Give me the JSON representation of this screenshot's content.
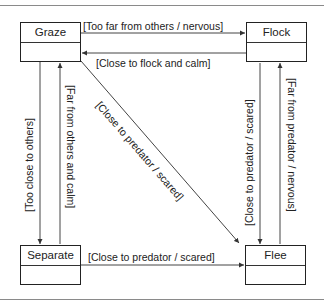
{
  "diagram": {
    "type": "state-diagram",
    "states": [
      {
        "id": "graze",
        "label": "Graze"
      },
      {
        "id": "flock",
        "label": "Flock"
      },
      {
        "id": "separate",
        "label": "Separate"
      },
      {
        "id": "flee",
        "label": "Flee"
      }
    ],
    "transitions": [
      {
        "from": "graze",
        "to": "flock",
        "label": "[Too far from others / nervous]"
      },
      {
        "from": "flock",
        "to": "graze",
        "label": "[Close to flock and calm]"
      },
      {
        "from": "graze",
        "to": "separate",
        "label": "[Too close to others]"
      },
      {
        "from": "separate",
        "to": "graze",
        "label": "[Far from others and calm]"
      },
      {
        "from": "graze",
        "to": "flee",
        "label": "[Close to predator / scared]"
      },
      {
        "from": "flock",
        "to": "flee",
        "label": "[Close to predator / scared]"
      },
      {
        "from": "flee",
        "to": "flock",
        "label": "[Far from predator / nervous]"
      },
      {
        "from": "separate",
        "to": "flee",
        "label": "[Close to predator / scared]"
      }
    ]
  }
}
